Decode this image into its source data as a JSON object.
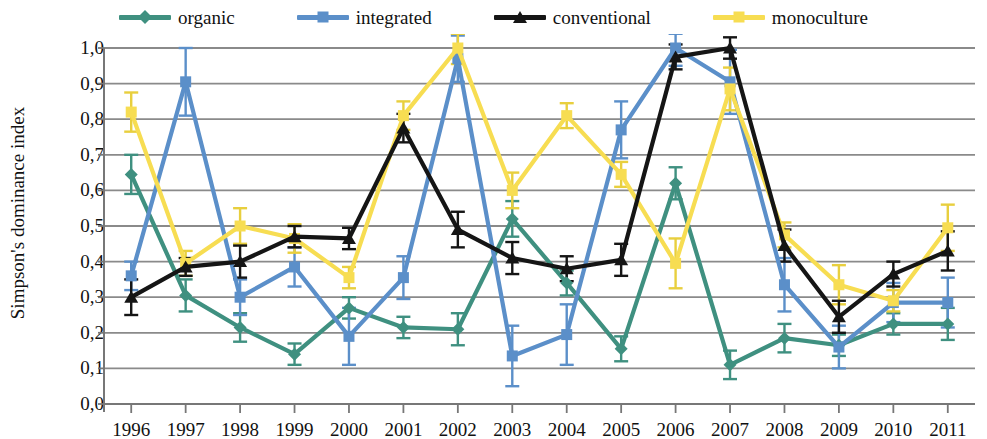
{
  "legend": {
    "items": [
      {
        "label": "organic",
        "color": "#3f9080",
        "marker": "diamond"
      },
      {
        "label": "integrated",
        "color": "#5b8fc9",
        "marker": "square"
      },
      {
        "label": "conventional",
        "color": "#151515",
        "marker": "triangle"
      },
      {
        "label": "monoculture",
        "color": "#f7dd52",
        "marker": "square"
      }
    ]
  },
  "axes": {
    "ylabel": "Simpson's dominance index",
    "yticks": [
      "1,0",
      "0,9",
      "0,8",
      "0,7",
      "0,6",
      "0,5",
      "0,4",
      "0,3",
      "0,2",
      "0,1",
      "0,0"
    ],
    "xticks": [
      "1996",
      "1997",
      "1998",
      "1999",
      "2000",
      "2001",
      "2002",
      "2003",
      "2004",
      "2005",
      "2006",
      "2007",
      "2008",
      "2009",
      "2010",
      "2011"
    ]
  },
  "chart_data": {
    "type": "line",
    "title": "",
    "xlabel": "",
    "ylabel": "Simpson's dominance index",
    "ylim": [
      0,
      1
    ],
    "grid": true,
    "legend_position": "top",
    "errorbars": true,
    "x": [
      1996,
      1997,
      1998,
      1999,
      2000,
      2001,
      2002,
      2003,
      2004,
      2005,
      2006,
      2007,
      2008,
      2009,
      2010,
      2011
    ],
    "categories": [
      "1996",
      "1997",
      "1998",
      "1999",
      "2000",
      "2001",
      "2002",
      "2003",
      "2004",
      "2005",
      "2006",
      "2007",
      "2008",
      "2009",
      "2010",
      "2011"
    ],
    "series": [
      {
        "name": "organic",
        "color": "#3f9080",
        "marker": "diamond",
        "values": [
          0.645,
          0.305,
          0.215,
          0.14,
          0.27,
          0.215,
          0.21,
          0.52,
          0.34,
          0.155,
          0.62,
          0.11,
          0.185,
          0.165,
          0.225,
          0.225
        ],
        "errors": [
          0.055,
          0.045,
          0.04,
          0.03,
          0.03,
          0.03,
          0.045,
          0.05,
          0.035,
          0.035,
          0.045,
          0.04,
          0.04,
          0.03,
          0.03,
          0.045
        ]
      },
      {
        "name": "integrated",
        "color": "#5b8fc9",
        "marker": "square",
        "values": [
          0.36,
          0.905,
          0.3,
          0.385,
          0.19,
          0.355,
          0.97,
          0.135,
          0.195,
          0.77,
          1.0,
          0.905,
          0.335,
          0.16,
          0.285,
          0.285
        ],
        "errors": [
          0.04,
          0.095,
          0.05,
          0.055,
          0.08,
          0.06,
          0.065,
          0.085,
          0.085,
          0.08,
          0.05,
          0.09,
          0.075,
          0.06,
          0.055,
          0.07
        ]
      },
      {
        "name": "conventional",
        "color": "#151515",
        "marker": "triangle",
        "values": [
          0.3,
          0.385,
          0.4,
          0.47,
          0.465,
          0.775,
          0.49,
          0.41,
          0.38,
          0.405,
          0.975,
          1.0,
          0.445,
          0.245,
          0.365,
          0.43
        ],
        "errors": [
          0.05,
          0.025,
          0.045,
          0.03,
          0.03,
          0.04,
          0.05,
          0.045,
          0.035,
          0.045,
          0.035,
          0.03,
          0.045,
          0.045,
          0.035,
          0.055
        ]
      },
      {
        "name": "monoculture",
        "color": "#f7dd52",
        "marker": "square",
        "values": [
          0.82,
          0.395,
          0.5,
          0.465,
          0.355,
          0.81,
          1.0,
          0.6,
          0.81,
          0.645,
          0.395,
          0.885,
          0.475,
          0.335,
          0.29,
          0.495
        ],
        "errors": [
          0.055,
          0.035,
          0.05,
          0.04,
          0.03,
          0.04,
          0.045,
          0.05,
          0.035,
          0.035,
          0.07,
          0.06,
          0.035,
          0.055,
          0.03,
          0.065
        ]
      }
    ]
  }
}
